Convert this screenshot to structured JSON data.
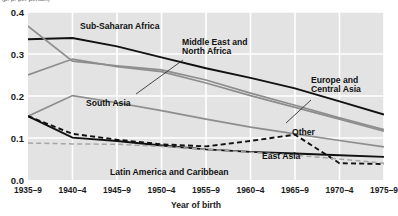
{
  "chart_data": {
    "type": "line",
    "title": "",
    "xlabel": "Year of birth",
    "ylabel": "(p. p. per person)",
    "categories": [
      "1935–9",
      "1940–4",
      "1945–9",
      "1950–4",
      "1955–9",
      "1960–4",
      "1965–9",
      "1970–4",
      "1975–9"
    ],
    "ylim": [
      0.0,
      0.4
    ],
    "yticks": [
      "0.0",
      "0.1",
      "0.2",
      "0.3",
      "0.4"
    ],
    "ytick_values": [
      0.0,
      0.1,
      0.2,
      0.3,
      0.4
    ],
    "grid": true,
    "legend_position": "inline-annotations",
    "series": [
      {
        "name": "Sub-Saharan Africa",
        "style": "solid",
        "color": "#111111",
        "width": 1.9,
        "values": [
          0.335,
          0.338,
          0.318,
          0.292,
          0.266,
          0.243,
          0.218,
          0.187,
          0.156
        ]
      },
      {
        "name": "Middle East and North Africa",
        "style": "solid",
        "color": "#8d8d8d",
        "width": 1.7,
        "values": [
          0.366,
          0.283,
          0.272,
          0.262,
          0.238,
          0.207,
          0.178,
          0.148,
          0.12
        ]
      },
      {
        "name": "Europe and Central Asia",
        "style": "solid",
        "color": "#8d8d8d",
        "width": 1.7,
        "values": [
          0.25,
          0.288,
          0.27,
          0.258,
          0.231,
          0.201,
          0.173,
          0.145,
          0.116
        ]
      },
      {
        "name": "South Asia",
        "style": "solid",
        "color": "#8d8d8d",
        "width": 1.7,
        "values": [
          0.152,
          0.201,
          0.184,
          0.165,
          0.145,
          0.126,
          0.11,
          0.094,
          0.079
        ]
      },
      {
        "name": "East Asia",
        "style": "solid",
        "color": "#111111",
        "width": 1.9,
        "values": [
          0.152,
          0.101,
          0.093,
          0.082,
          0.073,
          0.067,
          0.063,
          0.059,
          0.055
        ]
      },
      {
        "name": "Other",
        "style": "dashed",
        "color": "#111111",
        "width": 1.9,
        "values": [
          0.152,
          0.11,
          0.096,
          0.085,
          0.08,
          0.093,
          0.108,
          0.04,
          0.038
        ]
      },
      {
        "name": "Latin America and Caribbean",
        "style": "dashed",
        "color": "#a6a6a6",
        "width": 1.5,
        "values": [
          0.088,
          0.086,
          0.085,
          0.08,
          0.073,
          0.066,
          0.059,
          0.05,
          0.04
        ]
      }
    ],
    "annotations": [
      {
        "text": "Sub-Saharan Africa",
        "x": 80,
        "y": 22
      },
      {
        "text": "Middle East and",
        "x": 182,
        "y": 38
      },
      {
        "text": "North Africa",
        "x": 182,
        "y": 47
      },
      {
        "text": "Europe and",
        "x": 311,
        "y": 76
      },
      {
        "text": "Central Asia",
        "x": 311,
        "y": 85
      },
      {
        "text": "South Asia",
        "x": 86,
        "y": 99
      },
      {
        "text": "Other",
        "x": 292,
        "y": 128
      },
      {
        "text": "East Asia",
        "x": 262,
        "y": 152
      },
      {
        "text": "Latin America and Caribbean",
        "x": 110,
        "y": 168
      }
    ],
    "colors": {
      "plot_background": "#e3e3e3",
      "gridline": "#ffffff",
      "page_background": "#ffffff",
      "primary_line": "#111111",
      "secondary_line": "#8d8d8d"
    }
  }
}
